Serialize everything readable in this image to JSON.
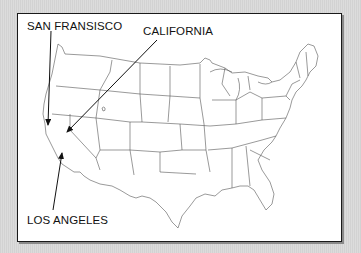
{
  "map": {
    "title": "Map of the contiguous United States",
    "background_color": "#d6d6d6",
    "frame_color": "#1a1a1a",
    "state_line_color": "#555555",
    "labels": [
      {
        "id": "san-francisco",
        "text": "SAN FRANSISCO"
      },
      {
        "id": "california",
        "text": "CALIFORNIA"
      },
      {
        "id": "los-angeles",
        "text": "LOS ANGELES"
      }
    ],
    "arrows": [
      {
        "label": "SAN FRANSISCO",
        "from": [
          51,
          30
        ],
        "to": [
          48,
          125
        ]
      },
      {
        "label": "CALIFORNIA",
        "from": [
          157,
          40
        ],
        "to": [
          66,
          133
        ]
      },
      {
        "label": "LOS ANGELES",
        "from": [
          53,
          210
        ],
        "to": [
          62,
          153
        ]
      }
    ]
  }
}
